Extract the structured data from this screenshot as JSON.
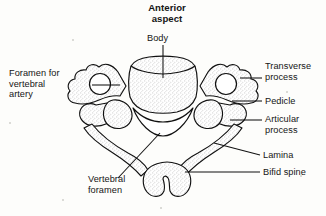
{
  "figure": {
    "title": "Anterior\naspect",
    "view": "superior view, anterior aspect at top",
    "background_color": "#fdfdfb",
    "ink_color": "#111111",
    "stipple_color": "#6b6b6b"
  },
  "labels": {
    "title": "Anterior\naspect",
    "body": "Body",
    "transverse_process": "Transverse\nprocess",
    "pedicle": "Pedicle",
    "articular_process": "Articular\nprocess",
    "lamina": "Lamina",
    "bifid_spine": "Bifid spine",
    "vertebral_foramen": "Vertebral\nforamen",
    "foramen_for_vertebral_artery": "Foramen for\nvertebral\nartery"
  },
  "structures": [
    {
      "name": "body",
      "label": "Body",
      "description": "rounded trapezoid centre-top, stippled"
    },
    {
      "name": "transverse-foramen-left",
      "label": "Foramen for vertebral artery",
      "description": "small circular hole in left transverse process"
    },
    {
      "name": "transverse-foramen-right",
      "label": "Foramen for vertebral artery",
      "description": "small circular hole in right transverse process"
    },
    {
      "name": "transverse-process-right",
      "label": "Transverse process"
    },
    {
      "name": "pedicle-right",
      "label": "Pedicle"
    },
    {
      "name": "articular-process-right",
      "label": "Articular process"
    },
    {
      "name": "lamina-right",
      "label": "Lamina"
    },
    {
      "name": "bifid-spine",
      "label": "Bifid spine",
      "description": "two-lobed spinous process at bottom centre"
    },
    {
      "name": "vertebral-foramen",
      "label": "Vertebral foramen",
      "description": "open triangular canal below body"
    }
  ]
}
